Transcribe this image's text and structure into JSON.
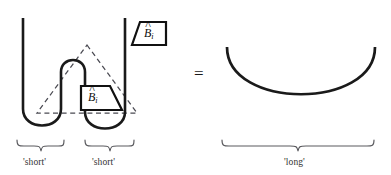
{
  "figure": {
    "type": "string-diagram-equation",
    "equals_sign": "=",
    "left_side": {
      "boxes": [
        {
          "id": "outer-box",
          "label_base": "B",
          "label_hat": "^",
          "label_sub": "i",
          "label_plain": "B̂i",
          "orientation": "left-slanted-trapezoid",
          "position": "top-right"
        },
        {
          "id": "inner-box",
          "label_base": "B",
          "label_hat": "^",
          "label_sub": "i",
          "label_plain": "B̂i",
          "orientation": "right-slanted-trapezoid",
          "position": "center"
        }
      ],
      "dashed_shape": "triangle",
      "braces": [
        {
          "id": "brace-short-left",
          "label": "'short'"
        },
        {
          "id": "brace-short-right",
          "label": "'short'"
        }
      ]
    },
    "right_side": {
      "shape": "wide-u-arc",
      "braces": [
        {
          "id": "brace-long",
          "label": "'long'"
        }
      ]
    },
    "colors": {
      "wire": "#1a1a1a",
      "dashed": "#4a4a52",
      "brace": "#5a5a5e",
      "background": "#ffffff",
      "text": "#2b2b2b"
    }
  }
}
